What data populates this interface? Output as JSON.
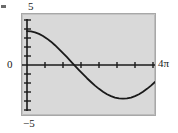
{
  "figure": {
    "background_color": "#ffffff",
    "plot_background_color": "#d9d9d9",
    "plot_border_color": "#a8a8a8",
    "curve_color": "#1a1a1a",
    "axis_color": "#1a1a1a",
    "artifact_name": "stray-mark"
  },
  "labels": {
    "y_max": "5",
    "y_min": "−5",
    "y_zero": "0",
    "x_max": "4π"
  },
  "chart_data": {
    "type": "line",
    "title": "",
    "xlabel": "",
    "ylabel": "",
    "xlim": [
      0,
      12.566370614359172
    ],
    "ylim": [
      -5,
      5
    ],
    "x_tick_count": 7,
    "y_tick_count": 9,
    "x_tick_labels": [
      "0",
      "4π"
    ],
    "y_tick_labels": [
      "5",
      "0",
      "−5"
    ],
    "grid": false,
    "legend": false,
    "legend_position": "none",
    "series": [
      {
        "name": "y = 3.3 cos(x/2)",
        "amplitude": 3.3,
        "period": 12.566370614359172,
        "x": [
          0.0,
          0.3926990817,
          0.7853981634,
          1.1780972451,
          1.5707963268,
          1.9634954085,
          2.3561944902,
          2.7488935719,
          3.1415926536,
          3.5342917353,
          3.926990817,
          4.3196898987,
          4.7123889804,
          5.1050880621,
          5.4977871438,
          5.8904862255,
          6.2831853072,
          6.6758843889,
          7.0685834706,
          7.4612825523,
          7.853981634,
          8.2466807157,
          8.6393797974,
          9.0320788791,
          9.4247779608,
          9.8174770425,
          10.2101761242,
          10.6028752059,
          10.9955742876,
          11.3882733693,
          11.780972451,
          12.1736715327,
          12.5663706144
        ],
        "y": [
          3.3,
          3.27,
          3.18,
          3.03,
          2.82,
          2.56,
          2.26,
          1.91,
          1.53,
          1.13,
          0.72,
          0.29,
          -0.13,
          -0.55,
          -0.96,
          -1.36,
          -1.73,
          -2.09,
          -2.41,
          -2.69,
          -2.94,
          -3.13,
          -3.27,
          -3.36,
          -3.38,
          -3.36,
          -3.27,
          -3.13,
          -2.94,
          -2.69,
          -2.41,
          -2.09,
          -1.73
        ]
      }
    ]
  }
}
